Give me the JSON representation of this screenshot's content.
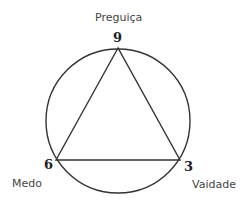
{
  "diagram": {
    "type": "enneagram-triad",
    "stroke_color": "#333333",
    "circle": {
      "cx": 118,
      "cy": 121,
      "r": 72
    },
    "triangle": {
      "points": [
        [
          118,
          48
        ],
        [
          56,
          160
        ],
        [
          180,
          160
        ]
      ]
    },
    "nodes": [
      {
        "number": "9",
        "label": "Preguiça"
      },
      {
        "number": "6",
        "label": "Medo"
      },
      {
        "number": "3",
        "label": "Vaidade"
      }
    ]
  }
}
